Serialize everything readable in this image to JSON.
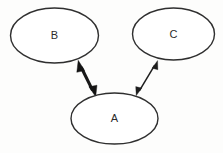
{
  "canvas": {
    "width": 223,
    "height": 153,
    "background_color": "#fdfdfc"
  },
  "diagram": {
    "type": "node-link-diagram",
    "title": "",
    "node_shape": "ellipse",
    "stroke_color": "#2f2f2f",
    "fill_color": "#ffffff",
    "label_color": "#2b2b2b",
    "nodes": [
      {
        "id": "B",
        "label": "B",
        "cx": 54.5,
        "cy": 35.5,
        "rx": 44,
        "ry": 27.5
      },
      {
        "id": "C",
        "label": "C",
        "cx": 173.5,
        "cy": 34,
        "rx": 41,
        "ry": 26
      },
      {
        "id": "A",
        "label": "A",
        "cx": 114.5,
        "cy": 118.5,
        "rx": 43.5,
        "ry": 25.5
      }
    ],
    "edges": [
      {
        "id": "edge-b-a",
        "from": "B",
        "to": "A",
        "direction": "bidirectional",
        "style": "thick",
        "stroke_color": "#181818",
        "stroke_width": 3.1,
        "x1": 79,
        "y1": 62,
        "x2": 95,
        "y2": 96
      },
      {
        "id": "edge-c-a",
        "from": "C",
        "to": "A",
        "direction": "bidirectional",
        "style": "thin",
        "stroke_color": "#1d1d1d",
        "stroke_width": 1.5,
        "x1": 157,
        "y1": 61,
        "x2": 137,
        "y2": 95
      }
    ]
  }
}
